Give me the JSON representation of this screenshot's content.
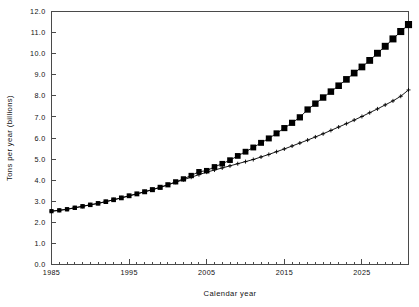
{
  "chart_data": {
    "type": "line",
    "title": "",
    "xlabel": "Calendar year",
    "ylabel": "Tons per year (billions)",
    "xlim": [
      1985,
      2031
    ],
    "ylim": [
      0.0,
      12.0
    ],
    "grid": false,
    "legend": "none",
    "x_major_ticks": [
      1985,
      1995,
      2005,
      2015,
      2025
    ],
    "x_major_tick_labels": [
      "1985",
      "1995",
      "2005",
      "2015",
      "2025"
    ],
    "x_minor_tick_step": 1,
    "y_ticks": [
      0.0,
      1.0,
      2.0,
      3.0,
      4.0,
      5.0,
      6.0,
      7.0,
      8.0,
      9.0,
      10.0,
      11.0,
      12.0
    ],
    "y_tick_labels": [
      "0.0",
      "1.0",
      "2.0",
      "3.0",
      "4.0",
      "5.0",
      "6.0",
      "7.0",
      "8.0",
      "9.0",
      "10.0",
      "11.0",
      "12.0"
    ],
    "x": [
      1985,
      1986,
      1987,
      1988,
      1989,
      1990,
      1991,
      1992,
      1993,
      1994,
      1995,
      1996,
      1997,
      1998,
      1999,
      2000,
      2001,
      2002,
      2003,
      2004,
      2005,
      2006,
      2007,
      2008,
      2009,
      2010,
      2011,
      2012,
      2013,
      2014,
      2015,
      2016,
      2017,
      2018,
      2019,
      2020,
      2021,
      2022,
      2023,
      2024,
      2025,
      2026,
      2027,
      2028,
      2029,
      2030,
      2031
    ],
    "series": [
      {
        "name": "high-growth-series",
        "marker": "filled-square",
        "values": [
          2.53,
          2.57,
          2.62,
          2.69,
          2.76,
          2.83,
          2.9,
          2.98,
          3.07,
          3.16,
          3.26,
          3.35,
          3.45,
          3.55,
          3.66,
          3.78,
          3.92,
          4.06,
          4.22,
          4.4,
          4.45,
          4.63,
          4.78,
          4.95,
          5.15,
          5.35,
          5.55,
          5.77,
          5.98,
          6.22,
          6.47,
          6.72,
          6.98,
          7.35,
          7.63,
          7.92,
          8.2,
          8.48,
          8.78,
          9.08,
          9.37,
          9.68,
          10.02,
          10.35,
          10.7,
          11.05,
          11.38
        ]
      },
      {
        "name": "low-growth-series",
        "marker": "plus",
        "values": [
          2.53,
          2.57,
          2.62,
          2.69,
          2.76,
          2.83,
          2.9,
          2.98,
          3.07,
          3.16,
          3.26,
          3.35,
          3.45,
          3.55,
          3.66,
          3.78,
          3.9,
          4.02,
          4.14,
          4.26,
          4.38,
          4.48,
          4.58,
          4.68,
          4.78,
          4.88,
          4.98,
          5.1,
          5.22,
          5.35,
          5.48,
          5.62,
          5.76,
          5.9,
          6.05,
          6.2,
          6.36,
          6.52,
          6.68,
          6.85,
          7.02,
          7.2,
          7.38,
          7.57,
          7.76,
          7.98,
          8.28
        ]
      }
    ]
  }
}
